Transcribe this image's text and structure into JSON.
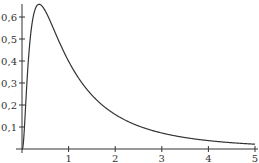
{
  "chart_data": {
    "type": "line",
    "title": "",
    "xlabel": "",
    "ylabel": "",
    "xlim": [
      0,
      5
    ],
    "ylim": [
      0,
      0.68
    ],
    "grid": false,
    "legend": null,
    "x_ticks": [
      1,
      2,
      3,
      4,
      5
    ],
    "x_tick_labels": [
      "1",
      "2",
      "3",
      "4",
      "5"
    ],
    "y_ticks": [
      0.1,
      0.2,
      0.3,
      0.4,
      0.5,
      0.6
    ],
    "y_tick_labels": [
      "0,1",
      "0,2",
      "0,3",
      "0,4",
      "0,5",
      "0,6"
    ],
    "series": [
      {
        "name": "density",
        "description": "log-normal density (mu=0, sigma=1)",
        "x": [
          0.02,
          0.05,
          0.1,
          0.15,
          0.2,
          0.25,
          0.3,
          0.37,
          0.45,
          0.5,
          0.6,
          0.7,
          0.8,
          0.9,
          1.0,
          1.25,
          1.5,
          1.75,
          2.0,
          2.5,
          3.0,
          3.5,
          4.0,
          4.5,
          5.0
        ],
        "y": [
          0.0,
          0.04,
          0.28,
          0.45,
          0.55,
          0.61,
          0.64,
          0.66,
          0.65,
          0.63,
          0.58,
          0.53,
          0.48,
          0.44,
          0.4,
          0.31,
          0.25,
          0.2,
          0.16,
          0.11,
          0.07,
          0.05,
          0.04,
          0.03,
          0.02
        ]
      }
    ],
    "color": "#333333"
  }
}
